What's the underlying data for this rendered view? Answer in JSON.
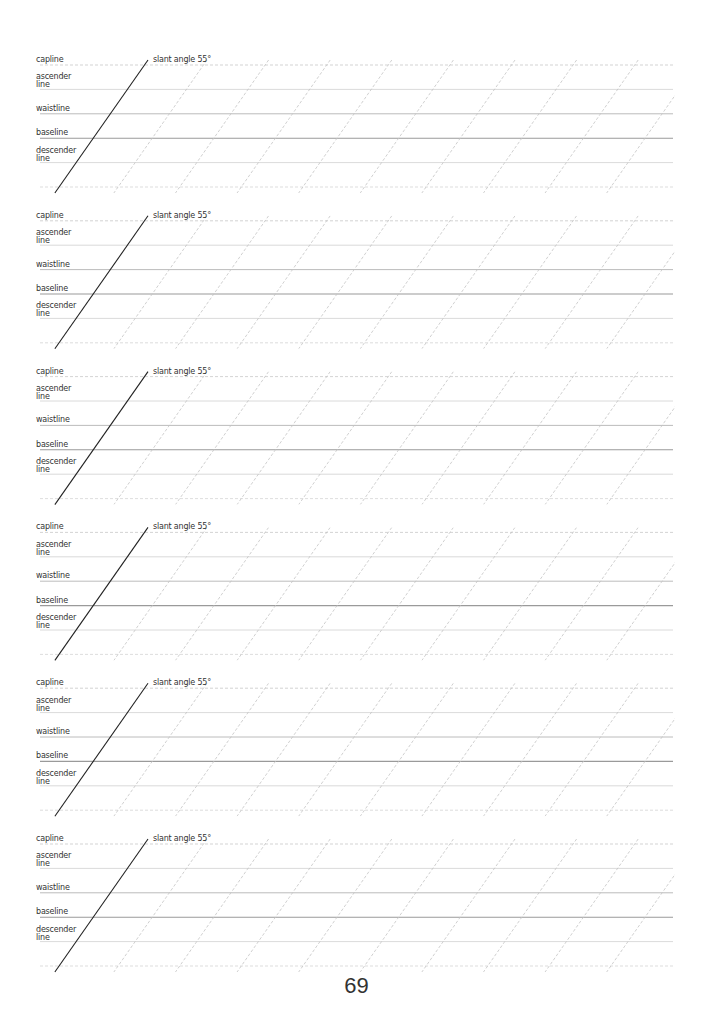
{
  "page": {
    "number": "69",
    "width": 713,
    "height": 1036
  },
  "guide_labels": {
    "capline": "capline",
    "ascender": "ascender line",
    "ascender_l1": "ascender",
    "ascender_l2": "line",
    "waistline": "waistline",
    "baseline": "baseline",
    "descender_l1": "descender",
    "descender_l2": "line",
    "slant": "slant angle 55°"
  },
  "layout": {
    "first_capline_y": 65,
    "block_spacing": 155.8,
    "row_spacing": 24.4,
    "line_start_x": 40,
    "line_end_x": 673,
    "slant_angle_deg": 55,
    "dashed_spacing": 61.6
  },
  "colors": {
    "capline": "#c8c8c8",
    "ascender": "#d0d0d0",
    "waistline": "#b4b4b4",
    "baseline": "#9a9a9a",
    "descender": "#d0d0d0",
    "bottom": "#d4d4d4",
    "slant_main": "#222222",
    "slant_dashed": "#c4c4c4"
  },
  "blocks": [
    {
      "id": 1
    },
    {
      "id": 2
    },
    {
      "id": 3
    },
    {
      "id": 4
    },
    {
      "id": 5
    },
    {
      "id": 6
    }
  ]
}
